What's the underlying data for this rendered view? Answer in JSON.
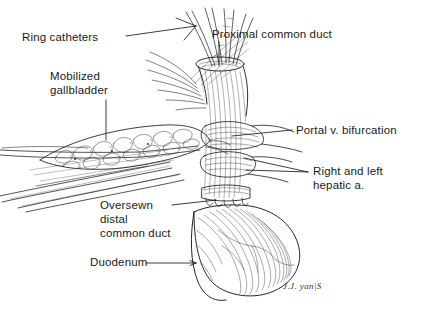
{
  "figure": {
    "background_color": "#ffffff",
    "ink_color": "#1a1a1a",
    "width": 430,
    "height": 311
  },
  "labels": {
    "ring_catheters": "Ring catheters",
    "mobilized_gallbladder_line1": "Mobilized",
    "mobilized_gallbladder_line2": "gallbladder",
    "proximal_common_duct": "Proximal common duct",
    "portal_v_bifurcation": "Portal v. bifurcation",
    "right_and_left_hepatic_line1": "Right and left",
    "right_and_left_hepatic_line2": "hepatic a.",
    "oversewn_distal_line1": "Oversewn",
    "oversewn_distal_line2": "distal",
    "oversewn_distal_line3": "common duct",
    "duodenum": "Duodenum"
  },
  "signature": {
    "text": "J.J. yan|S"
  }
}
